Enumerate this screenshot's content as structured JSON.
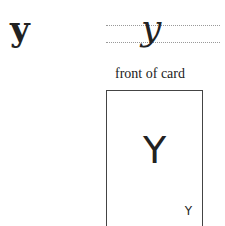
{
  "print_letter": "y",
  "cursive_letter": "y",
  "caption": "front of card",
  "card": {
    "main_letter": "Y",
    "corner_letter": "Y"
  }
}
